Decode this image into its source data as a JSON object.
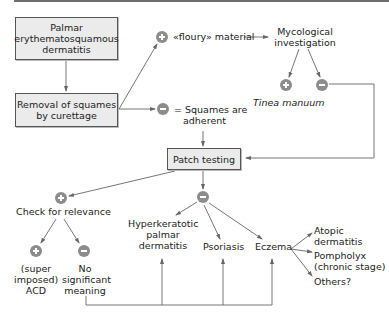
{
  "diagram": {
    "boxes": {
      "start": {
        "lines": [
          "Palmar",
          "erythematosquamous",
          "dermatitis"
        ]
      },
      "removal": {
        "lines": [
          "Removal of squames",
          "by curettage"
        ]
      },
      "patch": {
        "text": "Patch testing"
      }
    },
    "labels": {
      "floury": "«floury» material",
      "adherent_line1": "= Squames are",
      "adherent_line2": "adherent",
      "mycological_line1": "Mycological",
      "mycological_line2": "investigation",
      "tinea": "Tinea manuum",
      "check_relevance": "Check for relevance",
      "acd_line1": "(super",
      "acd_line2": "imposed)",
      "acd_line3": "ACD",
      "no_sig_line1": "No",
      "no_sig_line2": "significant",
      "no_sig_line3": "meaning",
      "hyper_line1": "Hyperkeratotic",
      "hyper_line2": "palmar",
      "hyper_line3": "dermatitis",
      "psoriasis": "Psoriasis",
      "eczema": "Eczema",
      "atopic_line1": "Atopic",
      "atopic_line2": "dermatitis",
      "pompholyx_line1": "Pompholyx",
      "pompholyx_line2": "(chronic stage)",
      "others": "Others?"
    },
    "nodes": {
      "positive": "+",
      "negative": "−"
    },
    "colors": {
      "box_fill": "#ebebeb",
      "node_fill": "#8c8c8c",
      "line": "#666666",
      "text": "#222222"
    }
  }
}
